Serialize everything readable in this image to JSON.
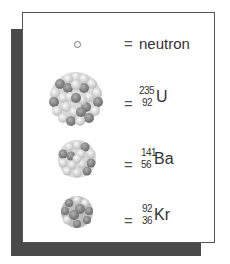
{
  "legend": {
    "rows": [
      {
        "symbol": "neutron-icon",
        "equals": "=",
        "label": "neutron"
      },
      {
        "symbol": "uranium-nucleus-icon",
        "equals": "=",
        "mass": "235",
        "atomic_number": "92",
        "element": "U"
      },
      {
        "symbol": "barium-nucleus-icon",
        "equals": "=",
        "mass": "141",
        "atomic_number": "56",
        "element": "Ba"
      },
      {
        "symbol": "krypton-nucleus-icon",
        "equals": "=",
        "mass": "92",
        "atomic_number": "36",
        "element": "Kr"
      }
    ]
  },
  "colors": {
    "panel_border": "#555555",
    "shadow": "#4a4a4a",
    "proton": "#8a8a8a",
    "neutron_fill": "#e6e6e6"
  }
}
